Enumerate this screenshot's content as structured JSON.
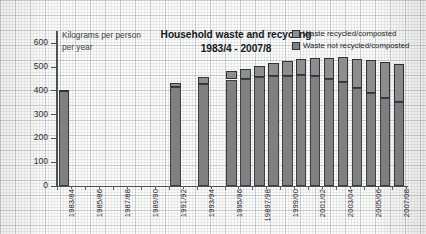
{
  "chart_data": {
    "type": "bar",
    "title": "Household waste and recycling",
    "subtitle": "1983/4 - 2007/8",
    "axis_note_line1": "Kilograms per person",
    "axis_note_line2": "per year",
    "ylabel": "Kilograms per person per year",
    "xlabel": "",
    "ylim": [
      0,
      650
    ],
    "yticks": [
      0,
      100,
      200,
      300,
      400,
      500,
      600
    ],
    "ytick_labels": [
      "0",
      "100",
      "200",
      "300",
      "400",
      "500",
      "600"
    ],
    "grid": true,
    "stacked": true,
    "legend_position": "top-right",
    "legend": [
      "Waste recycled/composted",
      "Waste not recycled/composted"
    ],
    "colors": {
      "recycled": "#8e8e8e",
      "not_recycled": "#808080",
      "axis": "#4a4f58",
      "text": "#16191e",
      "paper": "#fbfbf8"
    },
    "categories": [
      "1983/84",
      "1984/85",
      "1985/86",
      "1986/87",
      "1987/88",
      "1988/89",
      "1989/90",
      "1990/91",
      "1991/92",
      "1992/93",
      "1993/94",
      "1994/95",
      "1995/96",
      "1996/97",
      "1997/98",
      "1998/99",
      "1999/00",
      "2000/01",
      "2001/02",
      "2002/03",
      "2003/04",
      "2004/05",
      "2005/06",
      "2006/07",
      "2007/08"
    ],
    "xtick_labels": [
      "1983/84",
      "1985/86",
      "1987/88",
      "1989/90",
      "1991/92",
      "1993/94",
      "1995/96",
      "19897/98",
      "1999/00",
      "2001/02",
      "2003/04",
      "2005/06",
      "2007/08"
    ],
    "series": [
      {
        "name": "Waste not recycled/composted",
        "values": [
          397,
          null,
          null,
          null,
          null,
          null,
          null,
          null,
          413,
          null,
          428,
          null,
          446,
          450,
          455,
          461,
          462,
          463,
          459,
          448,
          437,
          412,
          388,
          367,
          350
        ]
      },
      {
        "name": "Waste recycled/composted",
        "values": [
          5,
          null,
          null,
          null,
          null,
          null,
          null,
          null,
          18,
          null,
          27,
          null,
          36,
          42,
          48,
          53,
          60,
          68,
          78,
          88,
          103,
          120,
          138,
          152,
          163
        ]
      }
    ],
    "totals": [
      402,
      null,
      null,
      null,
      null,
      null,
      null,
      null,
      431,
      null,
      455,
      null,
      482,
      492,
      503,
      514,
      522,
      531,
      537,
      536,
      540,
      532,
      526,
      519,
      513
    ],
    "bars": [
      {
        "category": "1983/84",
        "total": 402,
        "recycled": 5,
        "not_recycled": 397
      },
      {
        "category": "1991/92",
        "total": 431,
        "recycled": 18,
        "not_recycled": 413
      },
      {
        "category": "1993/94",
        "total": 455,
        "recycled": 27,
        "not_recycled": 428
      },
      {
        "category": "1995/96",
        "total": 482,
        "recycled": 36,
        "not_recycled": 446
      },
      {
        "category": "1996/97",
        "total": 492,
        "recycled": 42,
        "not_recycled": 450
      },
      {
        "category": "1997/98",
        "total": 503,
        "recycled": 48,
        "not_recycled": 455
      },
      {
        "category": "1998/99",
        "total": 514,
        "recycled": 53,
        "not_recycled": 461
      },
      {
        "category": "1999/00",
        "total": 522,
        "recycled": 60,
        "not_recycled": 462
      },
      {
        "category": "2000/01",
        "total": 531,
        "recycled": 68,
        "not_recycled": 463
      },
      {
        "category": "2001/02",
        "total": 537,
        "recycled": 78,
        "not_recycled": 459
      },
      {
        "category": "2002/03",
        "total": 536,
        "recycled": 88,
        "not_recycled": 448
      },
      {
        "category": "2003/04",
        "total": 540,
        "recycled": 103,
        "not_recycled": 437
      },
      {
        "category": "2004/05",
        "total": 532,
        "recycled": 120,
        "not_recycled": 412
      },
      {
        "category": "2005/06",
        "total": 526,
        "recycled": 138,
        "not_recycled": 388
      },
      {
        "category": "2006/07",
        "total": 519,
        "recycled": 152,
        "not_recycled": 367
      },
      {
        "category": "2007/08",
        "total": 513,
        "recycled": 163,
        "not_recycled": 350
      }
    ]
  }
}
